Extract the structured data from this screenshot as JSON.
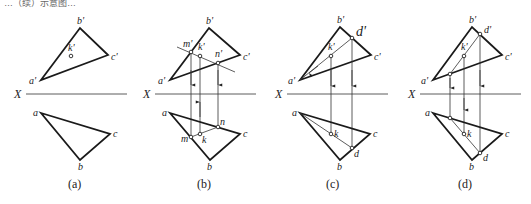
{
  "header": {
    "partial_text": "…（续）示意图…"
  },
  "axis_label": "X",
  "panels": [
    {
      "id": "a",
      "caption": "(a)",
      "labels": {
        "b_prime": "b'",
        "c_prime": "c'",
        "a_prime": "a'",
        "k_prime": "k'",
        "a": "a",
        "b": "b",
        "c": "c"
      }
    },
    {
      "id": "b",
      "caption": "(b)",
      "labels": {
        "b_prime": "b'",
        "c_prime": "c'",
        "a_prime": "a'",
        "k_prime": "k'",
        "m_prime": "m'",
        "n_prime": "n'",
        "a": "a",
        "b": "b",
        "c": "c",
        "k": "k",
        "m": "m",
        "n": "n"
      }
    },
    {
      "id": "c",
      "caption": "(c)",
      "labels": {
        "b_prime": "b'",
        "c_prime": "c'",
        "a_prime": "a'",
        "k_prime": "k'",
        "d_prime": "d'",
        "a": "a",
        "b": "b",
        "c": "c",
        "k": "k",
        "d": "d"
      }
    },
    {
      "id": "d",
      "caption": "(d)",
      "labels": {
        "b_prime": "b'",
        "c_prime": "c'",
        "a_prime": "a'",
        "k_prime": "k'",
        "d_prime": "d'",
        "a": "a",
        "b": "b",
        "c": "c",
        "k": "k",
        "d": "d"
      }
    }
  ]
}
